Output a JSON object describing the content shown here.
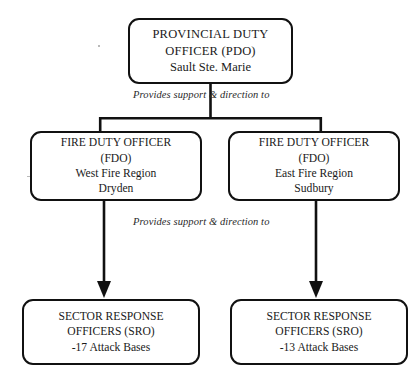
{
  "diagram": {
    "line_color": "#111111",
    "background_color": "#ffffff",
    "nodes": {
      "pdo": {
        "line1": "PROVINCIAL DUTY",
        "line2": "OFFICER (PDO)",
        "line3": "Sault Ste. Marie"
      },
      "fdo_west": {
        "line1": "FIRE DUTY OFFICER",
        "line2": "(FDO)",
        "line3": "West Fire Region",
        "line4": "Dryden"
      },
      "fdo_east": {
        "line1": "FIRE DUTY OFFICER",
        "line2": "(FDO)",
        "line3": "East Fire Region",
        "line4": "Sudbury"
      },
      "sro_west": {
        "line1": "SECTOR RESPONSE",
        "line2": "OFFICERS (SRO)",
        "line3": "-17 Attack Bases"
      },
      "sro_east": {
        "line1": "SECTOR RESPONSE",
        "line2": "OFFICERS (SRO)",
        "line3": "-13 Attack Bases"
      }
    },
    "edge_labels": {
      "top": "Provides support & direction to",
      "bottom": "Provides support & direction to"
    }
  }
}
